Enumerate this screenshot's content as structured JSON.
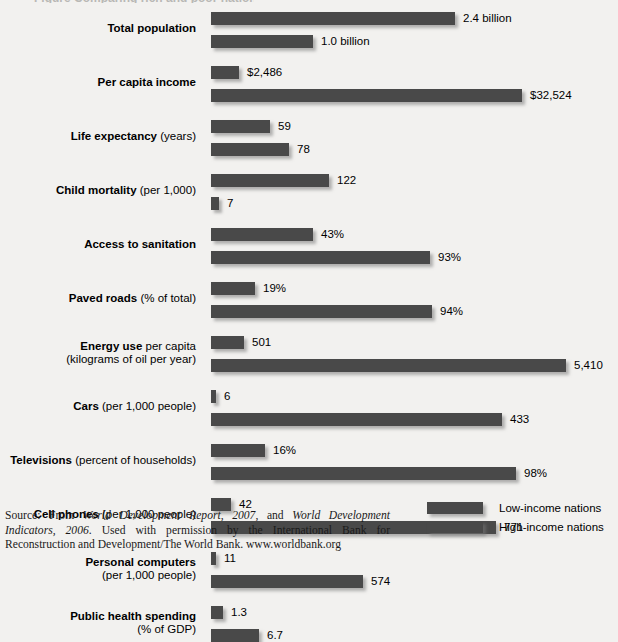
{
  "title_remnant": "Figure  Comparing rich and poor nations",
  "colors": {
    "bar": "#494949",
    "background": "#f2f1ef",
    "text": "#000000"
  },
  "legend": {
    "position": "bottom-right",
    "items": [
      {
        "label": "Low-income nations",
        "series": "low"
      },
      {
        "label": "High-income nations",
        "series": "high"
      }
    ]
  },
  "source": {
    "prefix": "Source: From ",
    "work1": "World Development Report, 2007",
    "mid1": ", and ",
    "work2": "World Development Indicators, 2006",
    "tail": ". Used with permission by the International Bank for Reconstruction and Development/The World Bank. www.worldbank.org"
  },
  "chart_data": {
    "type": "bar",
    "orientation": "horizontal",
    "xlabel": "",
    "ylabel": "",
    "grid": false,
    "legend_position": "bottom-right",
    "note": "Each indicator pair is drawn on its own independent scale; there is no shared numeric axis.",
    "categories": [
      "Total population",
      "Per capita income",
      "Life expectancy (years)",
      "Child mortality (per 1,000)",
      "Access to sanitation",
      "Paved roads (% of total)",
      "Energy use per capita (kilograms of oil per year)",
      "Cars (per 1,000 people)",
      "Televisions (percent of households)",
      "Cell phones (per 1,000 people)",
      "Personal computers (per 1,000 people)",
      "Public health spending (% of GDP)"
    ],
    "series": [
      {
        "name": "Low-income nations",
        "values": [
          2.4,
          2486,
          59,
          122,
          43,
          19,
          501,
          6,
          16,
          42,
          11,
          1.3
        ],
        "labels": [
          "2.4 billion",
          "$2,486",
          "59",
          "122",
          "43%",
          "19%",
          "501",
          "6",
          "16%",
          "42",
          "11",
          "1.3"
        ]
      },
      {
        "name": "High-income nations",
        "values": [
          1.0,
          32524,
          78,
          7,
          93,
          94,
          5410,
          433,
          98,
          771,
          574,
          6.7
        ],
        "labels": [
          "1.0 billion",
          "$32,524",
          "78",
          "7",
          "93%",
          "94%",
          "5,410",
          "433",
          "98%",
          "771",
          "574",
          "6.7"
        ]
      }
    ]
  },
  "rows": [
    {
      "label_main": "Total population",
      "label_sub": "",
      "label_line2": "",
      "low": {
        "value_label": "2.4 billion",
        "width": 244
      },
      "high": {
        "value_label": "1.0 billion",
        "width": 102
      }
    },
    {
      "label_main": "Per capita income",
      "label_sub": "",
      "label_line2": "",
      "low": {
        "value_label": "$2,486",
        "width": 28
      },
      "high": {
        "value_label": "$32,524",
        "width": 311
      }
    },
    {
      "label_main": "Life expectancy",
      "label_sub": " (years)",
      "label_line2": "",
      "low": {
        "value_label": "59",
        "width": 59
      },
      "high": {
        "value_label": "78",
        "width": 78
      }
    },
    {
      "label_main": "Child mortality",
      "label_sub": " (per 1,000)",
      "label_line2": "",
      "low": {
        "value_label": "122",
        "width": 118
      },
      "high": {
        "value_label": "7",
        "width": 8
      }
    },
    {
      "label_main": "Access to sanitation",
      "label_sub": "",
      "label_line2": "",
      "low": {
        "value_label": "43%",
        "width": 102
      },
      "high": {
        "value_label": "93%",
        "width": 219
      }
    },
    {
      "label_main": "Paved roads",
      "label_sub": " (% of total)",
      "label_line2": "",
      "low": {
        "value_label": "19%",
        "width": 44
      },
      "high": {
        "value_label": "94%",
        "width": 221
      }
    },
    {
      "label_main": "Energy use",
      "label_sub": " per capita",
      "label_line2": "(kilograms of oil per year)",
      "low": {
        "value_label": "501",
        "width": 33
      },
      "high": {
        "value_label": "5,410",
        "width": 355
      }
    },
    {
      "label_main": "Cars",
      "label_sub": " (per 1,000 people)",
      "label_line2": "",
      "low": {
        "value_label": "6",
        "width": 5
      },
      "high": {
        "value_label": "433",
        "width": 291
      }
    },
    {
      "label_main": "Televisions",
      "label_sub": " (percent of households)",
      "label_line2": "",
      "low": {
        "value_label": "16%",
        "width": 54
      },
      "high": {
        "value_label": "98%",
        "width": 305
      }
    },
    {
      "label_main": "Cell phones",
      "label_sub": " (per 1,000 people)",
      "label_line2": "",
      "low": {
        "value_label": "42",
        "width": 20
      },
      "high": {
        "value_label": "771",
        "width": 285
      }
    },
    {
      "label_main": "Personal computers",
      "label_sub": "",
      "label_line2": "(per 1,000 people)",
      "low": {
        "value_label": "11",
        "width": 5
      },
      "high": {
        "value_label": "574",
        "width": 152
      }
    },
    {
      "label_main": "Public health spending",
      "label_sub": "",
      "label_line2": "(% of GDP)",
      "low": {
        "value_label": "1.3",
        "width": 12
      },
      "high": {
        "value_label": "6.7",
        "width": 48
      }
    }
  ]
}
